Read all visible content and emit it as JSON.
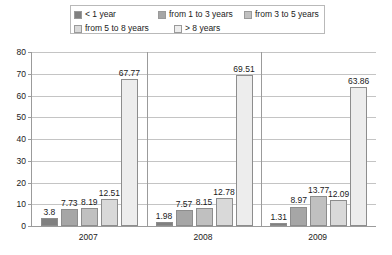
{
  "chart_data": {
    "type": "bar",
    "title": "",
    "xlabel": "",
    "ylabel": "",
    "categories": [
      "2007",
      "2008",
      "2009"
    ],
    "ylim": [
      0,
      80
    ],
    "yticks": [
      0,
      10,
      20,
      30,
      40,
      50,
      60,
      70,
      80
    ],
    "grid": true,
    "legend_position": "top",
    "series": [
      {
        "name": "< 1 year",
        "color": "#808080",
        "values": [
          3.8,
          1.98,
          1.31
        ]
      },
      {
        "name": "from 1 to 3 years",
        "color": "#a6a6a6",
        "values": [
          7.73,
          7.57,
          8.97
        ]
      },
      {
        "name": "from 3 to 5 years",
        "color": "#c0c0c0",
        "values": [
          8.19,
          8.15,
          13.77
        ]
      },
      {
        "name": "from 5 to 8 years",
        "color": "#d9d9d9",
        "values": [
          12.51,
          12.78,
          12.09
        ]
      },
      {
        "name": "> 8 years",
        "color": "#ededed",
        "values": [
          67.77,
          69.51,
          63.86
        ]
      }
    ],
    "data_labels": [
      [
        "3.8",
        "7.73",
        "8.19",
        "12.51",
        "67.77"
      ],
      [
        "1.98",
        "7.57",
        "8.15",
        "12.78",
        "69.51"
      ],
      [
        "1.31",
        "8.97",
        "13.77",
        "12.09",
        "63.86"
      ]
    ],
    "ytick_labels": [
      "0",
      "10",
      "20",
      "30",
      "40",
      "50",
      "60",
      "70",
      "80"
    ]
  }
}
